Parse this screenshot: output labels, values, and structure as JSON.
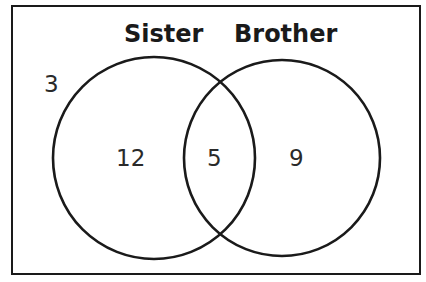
{
  "venn": {
    "sets": [
      {
        "name": "Sister",
        "only_value": "12"
      },
      {
        "name": "Brother",
        "only_value": "9"
      }
    ],
    "intersection_value": "5",
    "outside_value": "3",
    "stroke_color": "#1a1a1a",
    "background_color": "#ffffff"
  }
}
